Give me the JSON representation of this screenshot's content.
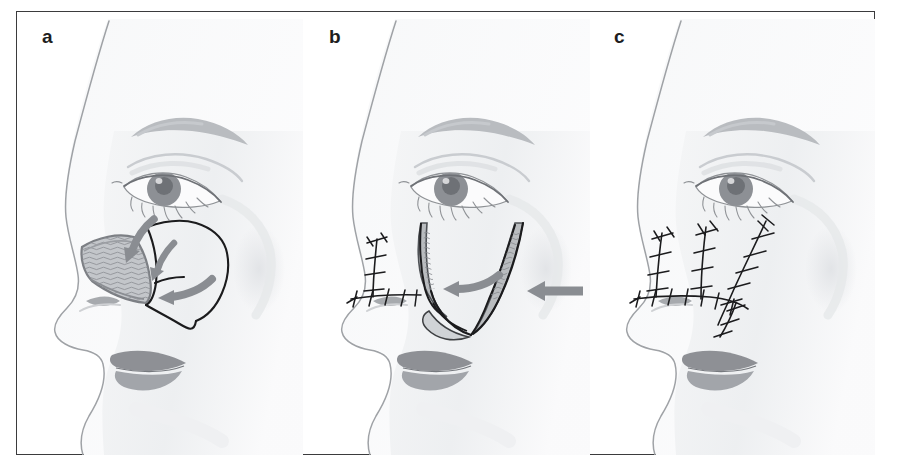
{
  "figure": {
    "kind": "medical-illustration",
    "panel_count": 3,
    "frame": {
      "border_color": "#3b3b3d",
      "background_color": "#ffffff",
      "border_width_px": 1.6
    },
    "palette": {
      "outline": "#8f9296",
      "skin_light": "#fbfbfc",
      "skin_shadow": "#e9eaec",
      "skin_shadow_deep": "#dcdee1",
      "brow": "#b9bcc0",
      "eye_iris": "#8d9095",
      "eye_iris_dark": "#6e7176",
      "lip_upper": "#8e9095",
      "lip_lower": "#a2a5aa",
      "nostril": "#a7aaae",
      "incision_line": "#1b1b1d",
      "flap_fill": "#c3c6ca",
      "flap_hatch": "#8b8e93",
      "arrow_gray": "#8a8d92",
      "suture_thread": "#1b1b1d"
    }
  },
  "panels": [
    {
      "id": "a",
      "label": "a",
      "caption_text": "a",
      "stage": "Defect and planned flap incisions marked",
      "features": [
        "triangular full-thickness defect on left nasal sidewall/ala with hatched wound bed",
        "black pen-marked incision outlining a laterally based cheek advancement flap",
        "three curved gray arrows indicating direction of flap transposition toward the defect",
        "nostril rim and alar margin visible",
        "eye, eyebrow, eyelashes and lips rendered in gray wash"
      ],
      "arrow_count": 3,
      "suture_line_count": 0
    },
    {
      "id": "b",
      "label": "b",
      "caption_text": "b",
      "stage": "Flap elevated and advanced medially; superior closure begun",
      "features": [
        "flap raised off the cheek showing shaded undersurface",
        "one straight gray arrow from lateral cheek indicating medial advancement vector",
        "one curved gray arrow showing rotation of the flap leading edge",
        "interrupted sutures already placed along the nasal dorsum and alar base",
        "defect partially closed at its medial border"
      ],
      "arrow_count": 2,
      "suture_line_count": 2
    },
    {
      "id": "c",
      "label": "c",
      "caption_text": "c",
      "stage": "Completed closure with interrupted sutures",
      "features": [
        "three sutured limbs: two near-vertical lines over nasal sidewall and nasofacial groove",
        "one oblique line running up the cheek toward the lateral canthus",
        "a horizontal sutured line along the alar base joining the vertical limbs",
        "short inferior sutured limb descending toward the nasolabial fold",
        "individual interrupted stitch ticks drawn across each suture line"
      ],
      "arrow_count": 0,
      "suture_line_count": 5
    }
  ]
}
